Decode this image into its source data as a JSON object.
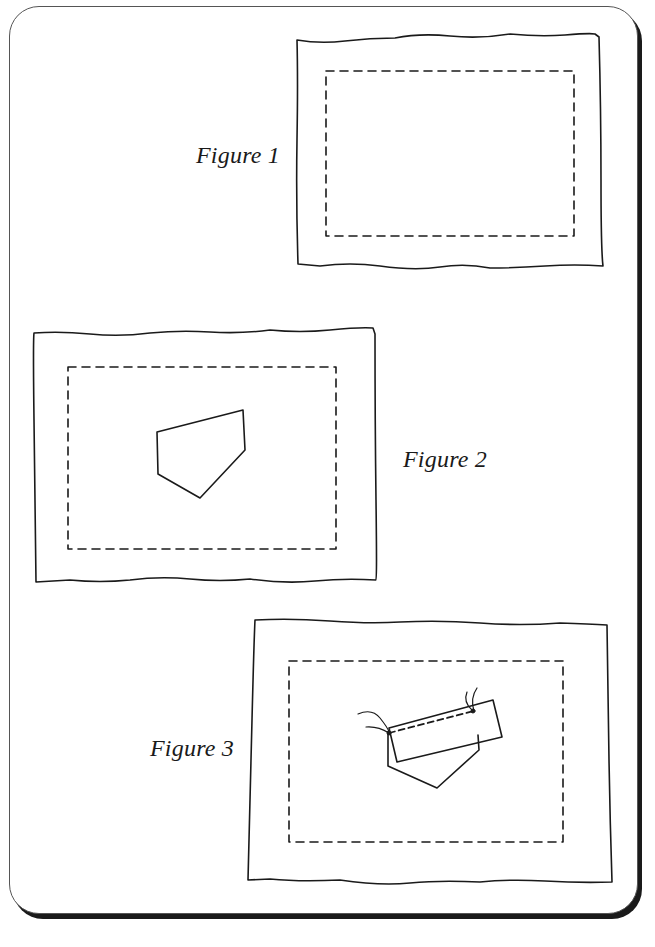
{
  "figures": [
    {
      "id": 1,
      "label": "Figure 1",
      "description": "Fabric rectangle with dashed stitching line inset"
    },
    {
      "id": 2,
      "label": "Figure 2",
      "description": "Fabric with pentagon-shaped patch placed in center"
    },
    {
      "id": 3,
      "label": "Figure 3",
      "description": "Rectangular strip stitched over pentagon patch with thread ends"
    }
  ],
  "colors": {
    "ink": "#1a1a1a",
    "paper": "#ffffff",
    "frame_shadow": "#1a1a1a"
  }
}
